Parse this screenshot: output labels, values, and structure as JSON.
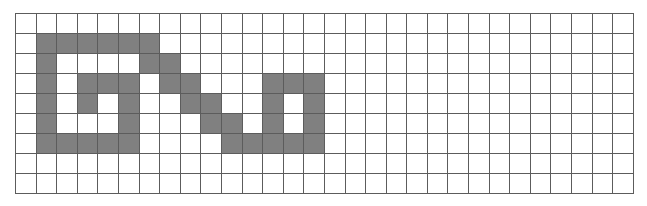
{
  "figure": {
    "name": "pixel-grid-pattern",
    "background_color": "#ffffff"
  },
  "grid": {
    "rows": 9,
    "cols": 30,
    "cell_width": 20.6,
    "cell_height": 20,
    "origin_x": 15,
    "origin_y": 13,
    "line_color": "#5c5c5c",
    "line_width": 1,
    "empty_cell_color": "#ffffff",
    "filled_cell_color": "#808080"
  },
  "chart_data": {
    "type": "heatmap",
    "title": "",
    "xlabel": "",
    "ylabel": "",
    "grid": true,
    "legend": "none",
    "rows": 9,
    "cols": 30,
    "value_labels": {
      "0": "empty",
      "1": "filled"
    },
    "matrix": [
      [
        0,
        0,
        0,
        0,
        0,
        0,
        0,
        0,
        0,
        0,
        0,
        0,
        0,
        0,
        0,
        0,
        0,
        0,
        0,
        0,
        0,
        0,
        0,
        0,
        0,
        0,
        0,
        0,
        0,
        0
      ],
      [
        0,
        1,
        1,
        1,
        1,
        1,
        1,
        0,
        0,
        0,
        0,
        0,
        0,
        0,
        0,
        0,
        0,
        0,
        0,
        0,
        0,
        0,
        0,
        0,
        0,
        0,
        0,
        0,
        0,
        0
      ],
      [
        0,
        1,
        0,
        0,
        0,
        0,
        1,
        1,
        0,
        0,
        0,
        0,
        0,
        0,
        0,
        0,
        0,
        0,
        0,
        0,
        0,
        0,
        0,
        0,
        0,
        0,
        0,
        0,
        0,
        0
      ],
      [
        0,
        1,
        0,
        1,
        1,
        1,
        0,
        1,
        1,
        0,
        0,
        0,
        1,
        1,
        1,
        0,
        0,
        0,
        0,
        0,
        0,
        0,
        0,
        0,
        0,
        0,
        0,
        0,
        0,
        0
      ],
      [
        0,
        1,
        0,
        1,
        0,
        1,
        0,
        0,
        1,
        1,
        0,
        0,
        1,
        0,
        1,
        0,
        0,
        0,
        0,
        0,
        0,
        0,
        0,
        0,
        0,
        0,
        0,
        0,
        0,
        0
      ],
      [
        0,
        1,
        0,
        0,
        0,
        1,
        0,
        0,
        0,
        1,
        1,
        0,
        1,
        0,
        1,
        0,
        0,
        0,
        0,
        0,
        0,
        0,
        0,
        0,
        0,
        0,
        0,
        0,
        0,
        0
      ],
      [
        0,
        1,
        1,
        1,
        1,
        1,
        0,
        0,
        0,
        0,
        1,
        1,
        1,
        1,
        1,
        0,
        0,
        0,
        0,
        0,
        0,
        0,
        0,
        0,
        0,
        0,
        0,
        0,
        0,
        0
      ],
      [
        0,
        0,
        0,
        0,
        0,
        0,
        0,
        0,
        0,
        0,
        0,
        0,
        0,
        0,
        0,
        0,
        0,
        0,
        0,
        0,
        0,
        0,
        0,
        0,
        0,
        0,
        0,
        0,
        0,
        0
      ],
      [
        0,
        0,
        0,
        0,
        0,
        0,
        0,
        0,
        0,
        0,
        0,
        0,
        0,
        0,
        0,
        0,
        0,
        0,
        0,
        0,
        0,
        0,
        0,
        0,
        0,
        0,
        0,
        0,
        0,
        0
      ]
    ]
  }
}
